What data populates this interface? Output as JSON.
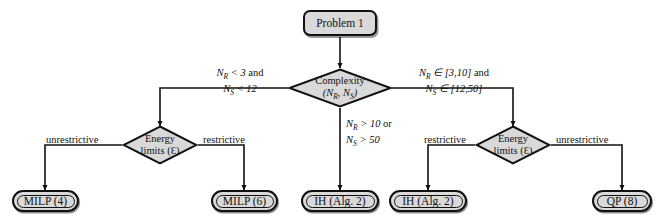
{
  "diagram": {
    "fill_color": "#d9d9d9",
    "stroke_color": "#111111"
  },
  "start": {
    "label": "Problem 1"
  },
  "decisions": [
    {
      "id": "complexity",
      "line1": "Complexity",
      "line2": "(Nᴿ, Nˢ)",
      "name_main": "Complexity",
      "vars": "(NR, NS)"
    },
    {
      "id": "energy-left",
      "line1": "Energy",
      "line2": "limits (Ɛ)"
    },
    {
      "id": "energy-right",
      "line1": "Energy",
      "line2": "limits (Ɛ)"
    }
  ],
  "edge_labels": {
    "complexity_left_l1": "N_R < 3 and",
    "complexity_left_l2": "N_S < 12",
    "complexity_right_l1": "N_R ∈ [3,10] and",
    "complexity_right_l2": "N_S ∈ [12,50]",
    "complexity_down_l1": "N_R > 10 or",
    "complexity_down_l2": "N_S > 50",
    "left_unrestrictive": "unrestrictive",
    "left_restrictive": "restrictive",
    "right_restrictive": "restrictive",
    "right_unrestrictive": "unrestrictive"
  },
  "terminals": [
    {
      "id": "milp4",
      "label": "MILP (4)"
    },
    {
      "id": "milp6",
      "label": "MILP (6)"
    },
    {
      "id": "ih2a",
      "label": "IH (Alg. 2)"
    },
    {
      "id": "ih2b",
      "label": "IH (Alg. 2)"
    },
    {
      "id": "qp8",
      "label": "QP (8)"
    }
  ]
}
